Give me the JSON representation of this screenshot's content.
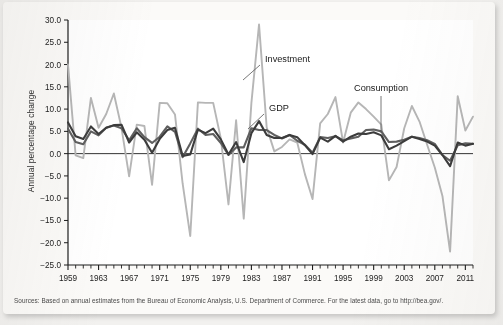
{
  "figure": {
    "y_axis_title": "Annual percentage change",
    "source_note": "Sources: Based on annual estimates from the Bureau of Economic Analysis, U.S. Department of Commerce. For the latest data, go to http://bea.gov/."
  },
  "annotations": [
    {
      "label": "Investment",
      "name": "annotation-investment"
    },
    {
      "label": "GDP",
      "name": "annotation-gdp"
    },
    {
      "label": "Consumption",
      "name": "annotation-consumption"
    }
  ],
  "colors": {
    "gdp": "#3c3c3c",
    "consumption": "#5f5f5f",
    "investment": "#b6b6b6",
    "axis": "#1d1d1d",
    "zero_line": "#1d1d1d",
    "paper": "#fbfaf8",
    "page": "#f2f1ef"
  },
  "chart_data": {
    "type": "line",
    "title": "",
    "subtitle": "",
    "xlabel": "",
    "ylabel": "Annual percentage change",
    "xlim": [
      1959,
      2012
    ],
    "ylim": [
      -25.0,
      30.0
    ],
    "grid": false,
    "legend": "annotations-inline",
    "zero_line": 0.0,
    "y_ticks": [
      30.0,
      25.0,
      20.0,
      15.0,
      10.0,
      5.0,
      0.0,
      -5.0,
      -10.0,
      -15.0,
      -20.0,
      -25.0
    ],
    "y_tick_labels": [
      "30.0",
      "25.0",
      "20.0",
      "15.0",
      "10.0",
      "5.0",
      "0.0",
      "-5.0",
      "-10.0",
      "-15.0",
      "-20.0",
      "-25.0"
    ],
    "x_tick_labels": [
      "1959",
      "1963",
      "1967",
      "1971",
      "1975",
      "1979",
      "1983",
      "1987",
      "1991",
      "1995",
      "1999",
      "2003",
      "2007",
      "2011"
    ],
    "x_tick_label_years": [
      1959,
      1963,
      1967,
      1971,
      1975,
      1979,
      1983,
      1987,
      1991,
      1995,
      1999,
      2003,
      2007,
      2011
    ],
    "x_minor_tick_interval": 1,
    "x": [
      1959,
      1960,
      1961,
      1962,
      1963,
      1964,
      1965,
      1966,
      1967,
      1968,
      1969,
      1970,
      1971,
      1972,
      1973,
      1974,
      1975,
      1976,
      1977,
      1978,
      1979,
      1980,
      1981,
      1982,
      1983,
      1984,
      1985,
      1986,
      1987,
      1988,
      1989,
      1990,
      1991,
      1992,
      1993,
      1994,
      1995,
      1996,
      1997,
      1998,
      1999,
      2000,
      2001,
      2002,
      2003,
      2004,
      2005,
      2006,
      2007,
      2008,
      2009,
      2010,
      2011,
      2012
    ],
    "series": [
      {
        "name": "GDP",
        "color": "#3c3c3c",
        "width": 2.1,
        "values": [
          7.0,
          3.9,
          3.3,
          6.1,
          4.4,
          5.8,
          6.4,
          6.5,
          2.5,
          4.8,
          3.1,
          0.2,
          3.3,
          5.3,
          5.8,
          -0.5,
          -0.2,
          5.4,
          4.6,
          5.6,
          3.2,
          -0.2,
          2.6,
          -1.9,
          4.6,
          7.3,
          4.2,
          3.5,
          3.5,
          4.2,
          3.7,
          1.9,
          -0.1,
          3.6,
          2.7,
          4.0,
          2.7,
          3.8,
          4.5,
          4.4,
          4.8,
          4.1,
          1.0,
          1.8,
          2.8,
          3.8,
          3.3,
          2.7,
          1.8,
          -0.3,
          -2.8,
          2.5,
          1.8,
          2.2
        ]
      },
      {
        "name": "Consumption",
        "color": "#5f5f5f",
        "width": 2.1,
        "values": [
          5.6,
          2.6,
          2.1,
          5.0,
          4.1,
          5.8,
          6.3,
          5.7,
          3.0,
          5.7,
          3.7,
          2.4,
          3.8,
          6.1,
          4.9,
          -0.8,
          2.3,
          5.6,
          4.2,
          4.4,
          2.4,
          -0.3,
          1.4,
          1.4,
          5.7,
          5.3,
          5.3,
          4.2,
          3.4,
          4.2,
          2.9,
          2.0,
          0.2,
          3.7,
          3.5,
          3.9,
          3.0,
          3.4,
          3.8,
          5.3,
          5.4,
          5.0,
          2.6,
          2.7,
          3.1,
          3.8,
          3.5,
          3.0,
          2.2,
          -0.3,
          -1.6,
          1.9,
          2.3,
          2.2
        ]
      },
      {
        "name": "Investment",
        "color": "#b6b6b6",
        "width": 1.9,
        "values": [
          20.0,
          -0.4,
          -1.0,
          12.5,
          5.8,
          8.9,
          13.5,
          5.8,
          -5.1,
          6.5,
          6.2,
          -7.0,
          11.4,
          11.3,
          8.8,
          -6.7,
          -18.5,
          11.5,
          11.4,
          11.4,
          3.4,
          -11.4,
          7.5,
          -14.6,
          11.4,
          29.0,
          5.9,
          0.5,
          1.5,
          3.2,
          2.5,
          -4.6,
          -10.2,
          6.8,
          8.9,
          12.7,
          2.5,
          9.2,
          11.5,
          10.0,
          8.3,
          6.5,
          -6.0,
          -3.0,
          5.7,
          10.7,
          7.2,
          2.0,
          -3.1,
          -9.5,
          -22.0,
          12.9,
          5.2,
          8.3
        ]
      }
    ],
    "annotations": [
      {
        "text": "Investment",
        "points_to_year": 1984,
        "points_to_value": 22.0
      },
      {
        "text": "GDP",
        "points_to_year": 1984,
        "points_to_value": 7.3
      },
      {
        "text": "Consumption",
        "points_to_year": 1999,
        "points_to_value": 5.4
      }
    ]
  }
}
